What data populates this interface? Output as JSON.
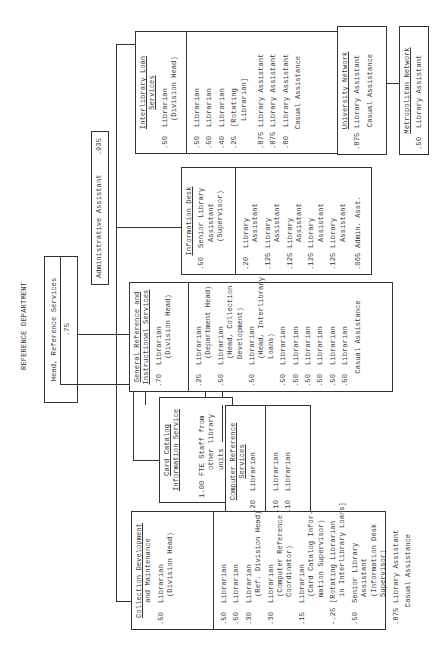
{
  "title": "REFERENCE DEPARTMENT",
  "head": {
    "label": "Head, Reference Services",
    "fte": ".75"
  },
  "admin": {
    "label": "Administrative Assistant",
    "fte": ".935"
  },
  "units": {
    "interlibrary": {
      "title1": "Interlibrary Loan",
      "title2": "Services",
      "lead": {
        "fte": ".50",
        "role": "Librarian",
        "note": "(Division Head)"
      },
      "staff": [
        {
          "fte": ".50",
          "role": "Librarian"
        },
        {
          "fte": ".50",
          "role": "Librarian"
        },
        {
          "fte": ".40",
          "role": "Librarian"
        },
        {
          "fte": ".25",
          "role": "[Rotating",
          "note": "Librarian]"
        },
        {
          "fte": ".875",
          "role": "Library Assistant"
        },
        {
          "fte": ".875",
          "role": "Library Assistant"
        },
        {
          "fte": ".80",
          "role": "Library Assistant"
        }
      ],
      "casual": "Casual Assistance"
    },
    "university": {
      "title": "University Network",
      "staff": [
        {
          "fte": ".875",
          "role": "Library Assistant"
        }
      ],
      "casual": "Casual Assistance"
    },
    "metropolitan": {
      "title": "Metropolitan Network",
      "staff": [
        {
          "fte": ".50",
          "role": "Library Assistant"
        }
      ]
    },
    "info_desk": {
      "title": "Information Desk",
      "lead": {
        "fte": ".50",
        "role": "Senior Library",
        "note1": "Assistant",
        "note2": "(Supervisor)"
      },
      "staff": [
        {
          "fte": ".20",
          "role": "Library",
          "note": "Assistant"
        },
        {
          "fte": ".125",
          "role": "Library",
          "note": "Assistant"
        },
        {
          "fte": ".125",
          "role": "Library",
          "note": "Assistant"
        },
        {
          "fte": ".125",
          "role": "Library",
          "note": "Assistant"
        },
        {
          "fte": ".125",
          "role": "Library",
          "note": "Assistant"
        },
        {
          "fte": ".065",
          "role": "Admin. Asst."
        }
      ]
    },
    "general_ref": {
      "title1": "General Reference and",
      "title2": "Instructional Services",
      "lead": {
        "fte": ".70",
        "role": "Librarian",
        "note": "(Division Head)"
      },
      "staff": [
        {
          "fte": ".25",
          "role": "Librarian",
          "note": "(Department Head)"
        },
        {
          "fte": ".50",
          "role": "Librarian",
          "note": "(Head, Collection",
          "note2": "Development)"
        },
        {
          "fte": ".50",
          "role": "Librarian",
          "note": "(Head, Interlibrary",
          "note2": "Loans)"
        },
        {
          "fte": ".50",
          "role": "Librarian"
        },
        {
          "fte": ".50",
          "role": "Librarian"
        },
        {
          "fte": ".50",
          "role": "Librarian"
        },
        {
          "fte": ".50",
          "role": "Librarian"
        },
        {
          "fte": ".50",
          "role": "Librarian"
        },
        {
          "fte": ".50",
          "role": "Librarian"
        }
      ],
      "casual": "Casual Assistance"
    },
    "card_catalog": {
      "title1": "Card Catalog",
      "title2": "Information Service",
      "lead": {
        "fte": ".25",
        "role": "Librarian",
        "note": "(Supervisor)"
      },
      "other": {
        "fte": "1.00",
        "line1": "FTE Staff from",
        "line2": "other library",
        "line3": "units"
      }
    },
    "computer_ref": {
      "title1": "Computer Reference",
      "title2": "Services",
      "lead": {
        "fte": ".20",
        "role": "Librarian",
        "note": "(Coordinator)"
      },
      "staff": [
        {
          "fte": ".10",
          "role": "Librarian"
        },
        {
          "fte": ".10",
          "role": "Librarian"
        }
      ]
    },
    "collection": {
      "title1": "Collection Development",
      "title2": "and Maintenance",
      "lead": {
        "fte": ".50",
        "role": "Librarian",
        "note": "(Division Head)"
      },
      "staff": [
        {
          "fte": ".50",
          "role": "Librarian"
        },
        {
          "fte": ".50",
          "role": "Librarian"
        },
        {
          "fte": ".30",
          "role": "Librarian",
          "note": "(Ref. Division Head)"
        },
        {
          "fte": ".30",
          "role": "Librarian",
          "note": "(Computer Reference",
          "note2": "Coordinator)"
        },
        {
          "fte": ".15",
          "role": "Librarian",
          "note": "(Card Catalog Infor-",
          "note2": "mation Supervisor)"
        },
        {
          "fte": "-.25",
          "role": "[Rotating Librarian",
          "note": "in Interlibrary Loans]"
        },
        {
          "fte": ".50",
          "role": "Senior Library",
          "note": "Assistant",
          "note2": "(Information Desk",
          "note3": "Supervisor)"
        },
        {
          "fte": ".875",
          "role": "Library Assistant"
        }
      ],
      "casual": "Casual Assistance"
    }
  }
}
